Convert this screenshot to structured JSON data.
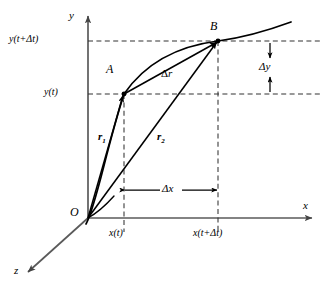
{
  "figure": {
    "type": "vector-kinematics-diagram",
    "caption": ""
  },
  "axes": {
    "x_label": "x",
    "y_label": "y",
    "z_label": "z",
    "origin_label": "O"
  },
  "points": {
    "a_label": "A",
    "b_label": "B"
  },
  "vectors": {
    "r1": {
      "symbol": "r",
      "subscript": "1"
    },
    "r2": {
      "symbol": "r",
      "subscript": "2"
    },
    "dr": {
      "delta": "Δ",
      "symbol": "r"
    }
  },
  "ticks": {
    "y_lower": "y(t)",
    "y_upper": "y(t+Δt)",
    "x_lower": "x(t)",
    "x_upper": "x(t+Δt)"
  },
  "dimensions": {
    "dx": "Δx",
    "dy": "Δy"
  },
  "colors": {
    "axis": "#5a5a5a",
    "curve": "#000000",
    "vector": "#000000",
    "dashed": "#333333",
    "background": "#ffffff"
  }
}
